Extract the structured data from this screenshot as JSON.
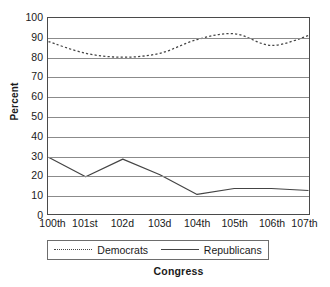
{
  "chart_data": {
    "type": "line",
    "title": "",
    "xlabel": "Congress",
    "ylabel": "Percent",
    "categories": [
      "100th",
      "101st",
      "102d",
      "103d",
      "104th",
      "105th",
      "106th",
      "107th"
    ],
    "ylim": [
      0,
      100
    ],
    "yticks": [
      100,
      90,
      80,
      70,
      60,
      50,
      40,
      30,
      20,
      10,
      0
    ],
    "grid": true,
    "legend_position": "bottom",
    "series": [
      {
        "name": "Democrats",
        "style": "dotted",
        "color": "#444444",
        "values": [
          88,
          82,
          80,
          82,
          89,
          92,
          86,
          91
        ]
      },
      {
        "name": "Republicans",
        "style": "solid",
        "color": "#444444",
        "values": [
          29,
          19,
          28,
          20,
          10,
          13,
          13,
          12
        ]
      }
    ]
  },
  "axis": {
    "y_title": "Percent",
    "x_title": "Congress"
  },
  "legend": {
    "items": [
      {
        "label": "Democrats",
        "style": "dotted"
      },
      {
        "label": "Republicans",
        "style": "solid"
      }
    ]
  }
}
